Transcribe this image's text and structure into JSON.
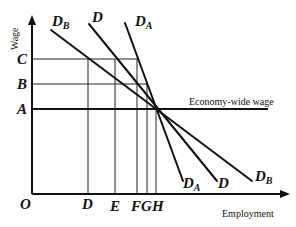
{
  "diagram": {
    "axes": {
      "y_label": "Wage",
      "x_label": "Employment",
      "origin": "O"
    },
    "wage_levels": [
      {
        "label": "C",
        "y": 59
      },
      {
        "label": "B",
        "y": 84
      },
      {
        "label": "A",
        "y": 109
      }
    ],
    "employment_levels": [
      {
        "label": "D",
        "x": 88
      },
      {
        "label": "E",
        "x": 115
      },
      {
        "label": "F",
        "x": 137
      },
      {
        "label": "G",
        "x": 147
      },
      {
        "label": "H",
        "x": 156
      }
    ],
    "horizontal_line_label": "Economy-wide wage",
    "demand_curves": [
      {
        "name": "D_B",
        "main": "D",
        "sub": "B",
        "top_label": "D_B",
        "bottom_label": "D_B"
      },
      {
        "name": "D",
        "main": "D",
        "sub": "",
        "top_label": "D",
        "bottom_label": "D"
      },
      {
        "name": "D_A",
        "main": "D",
        "sub": "A",
        "top_label": "D_A",
        "bottom_label": "D_A"
      }
    ],
    "labels": {
      "curve_db_top_main": "D",
      "curve_db_top_sub": "B",
      "curve_d_top": "D",
      "curve_da_top_main": "D",
      "curve_da_top_sub": "A",
      "curve_da_bottom_main": "D",
      "curve_da_bottom_sub": "A",
      "curve_d_bottom": "D",
      "curve_db_bottom_main": "D",
      "curve_db_bottom_sub": "B",
      "wage_c": "C",
      "wage_b": "B",
      "wage_a": "A",
      "emp_d": "D",
      "emp_e": "E",
      "emp_f": "F",
      "emp_g": "G",
      "emp_h": "H"
    }
  }
}
